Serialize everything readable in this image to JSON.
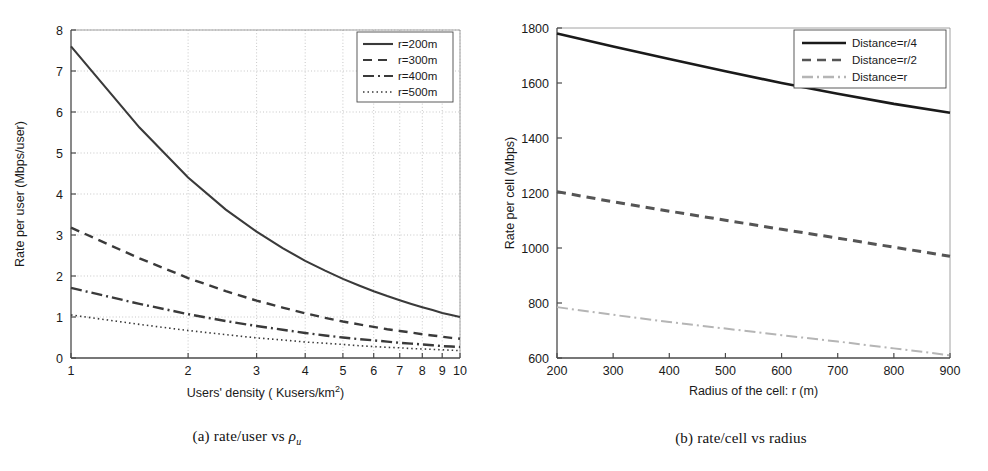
{
  "figure_a": {
    "caption_prefix": "(a)",
    "caption_text": "rate/user vs",
    "caption_symbol": "ρ",
    "caption_subscript": "u",
    "chart_data": {
      "type": "line",
      "title": "",
      "xlabel": "Users' density ( Kusers/km2)",
      "xlabel_base": "Users' density ( Kusers/km",
      "xlabel_sup": "2",
      "xlabel_tail": ")",
      "ylabel": "Rate per user (Mbps/user)",
      "xscale": "log",
      "yscale": "linear",
      "xlim": [
        1,
        10
      ],
      "ylim": [
        0,
        8
      ],
      "xticks": [
        1,
        2,
        3,
        4,
        5,
        6,
        7,
        8,
        9,
        10
      ],
      "xticklabels": [
        "1",
        "2",
        "3",
        "4",
        "5",
        "6",
        "7",
        "8",
        "9",
        "10"
      ],
      "yticks": [
        0,
        1,
        2,
        3,
        4,
        5,
        6,
        7,
        8
      ],
      "yticklabels": [
        "0",
        "1",
        "2",
        "3",
        "4",
        "5",
        "6",
        "7",
        "8"
      ],
      "grid": true,
      "legend_position": "upper right",
      "x": [
        1,
        1.5,
        2,
        2.5,
        3,
        3.5,
        4,
        4.5,
        5,
        5.5,
        6,
        6.5,
        7,
        7.5,
        8,
        8.5,
        9,
        9.5,
        10
      ],
      "series": [
        {
          "name": "r=200m",
          "style": "solid",
          "color": "#3a3a3a",
          "values": [
            7.6,
            5.62,
            4.4,
            3.62,
            3.08,
            2.68,
            2.37,
            2.13,
            1.93,
            1.77,
            1.63,
            1.51,
            1.41,
            1.32,
            1.24,
            1.17,
            1.1,
            1.05,
            1.0
          ]
        },
        {
          "name": "r=300m",
          "style": "dashed",
          "color": "#3a3a3a",
          "values": [
            3.18,
            2.43,
            1.95,
            1.63,
            1.4,
            1.23,
            1.09,
            0.98,
            0.89,
            0.82,
            0.76,
            0.7,
            0.66,
            0.62,
            0.58,
            0.55,
            0.52,
            0.49,
            0.47
          ]
        },
        {
          "name": "r=400m",
          "style": "dashdot",
          "color": "#3a3a3a",
          "values": [
            1.71,
            1.32,
            1.07,
            0.9,
            0.78,
            0.69,
            0.61,
            0.55,
            0.5,
            0.46,
            0.43,
            0.4,
            0.37,
            0.35,
            0.33,
            0.31,
            0.29,
            0.28,
            0.27
          ]
        },
        {
          "name": "r=500m",
          "style": "dotted",
          "color": "#3a3a3a",
          "values": [
            1.05,
            0.82,
            0.67,
            0.57,
            0.49,
            0.44,
            0.39,
            0.36,
            0.33,
            0.3,
            0.28,
            0.26,
            0.25,
            0.23,
            0.22,
            0.21,
            0.2,
            0.19,
            0.18
          ]
        }
      ]
    }
  },
  "figure_b": {
    "caption_prefix": "(b)",
    "caption_text": "rate/cell vs radius",
    "chart_data": {
      "type": "line",
      "title": "",
      "xlabel": "Radius of the cell: r (m)",
      "ylabel": "Rate per cell (Mbps)",
      "xscale": "linear",
      "yscale": "linear",
      "xlim": [
        200,
        900
      ],
      "ylim": [
        600,
        1800
      ],
      "xticks": [
        200,
        300,
        400,
        500,
        600,
        700,
        800,
        900
      ],
      "xticklabels": [
        "200",
        "300",
        "400",
        "500",
        "600",
        "700",
        "800",
        "900"
      ],
      "yticks": [
        600,
        800,
        1000,
        1200,
        1400,
        1600,
        1800
      ],
      "yticklabels": [
        "600",
        "800",
        "1000",
        "1200",
        "1400",
        "1600",
        "1800"
      ],
      "grid": false,
      "legend_position": "upper right",
      "x": [
        200,
        300,
        400,
        500,
        600,
        700,
        800,
        900
      ],
      "series": [
        {
          "name": "Distance=r/4",
          "style": "solid",
          "color": "#1a1a1a",
          "values": [
            1780,
            1733,
            1687,
            1643,
            1600,
            1561,
            1524,
            1492
          ]
        },
        {
          "name": "Distance=r/2",
          "style": "dashed",
          "color": "#555555",
          "values": [
            1205,
            1168,
            1134,
            1101,
            1068,
            1036,
            1003,
            970
          ]
        },
        {
          "name": "Distance=r",
          "style": "dashdot",
          "color": "#b5b5b5",
          "values": [
            785,
            757,
            731,
            707,
            683,
            660,
            635,
            610
          ]
        }
      ]
    }
  }
}
